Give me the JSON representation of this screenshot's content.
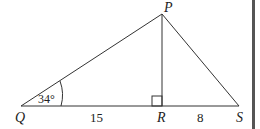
{
  "diagram": {
    "vertices": {
      "Q": "Q",
      "P": "P",
      "R": "R",
      "S": "S"
    },
    "angle_Q": "34°",
    "length_QR": "15",
    "length_RS": "8",
    "right_angle_at": "R",
    "colors": {
      "line": "#333333",
      "right_bar": "#555555",
      "background": "#ffffff"
    }
  }
}
